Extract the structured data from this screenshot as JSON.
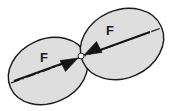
{
  "figure": {
    "background_color": "#ffffff",
    "body_fill_color": "#dedede",
    "body_stroke_color": "#1a1a1a",
    "line_color": "#1a1a1a",
    "arrow_color": "#141414",
    "contact_point_fill": "#ffffff",
    "labels": {
      "left_force": "F",
      "right_force": "F"
    },
    "bodies": [
      {
        "name": "left-body",
        "cx": 48,
        "cy": 71,
        "rx": 41,
        "ry": 32,
        "rotation_deg": -24,
        "label": "F",
        "label_x": 44,
        "label_y": 62
      },
      {
        "name": "right-body",
        "cx": 122,
        "cy": 44,
        "rx": 43,
        "ry": 34,
        "rotation_deg": -24,
        "label": "F",
        "label_x": 110,
        "label_y": 35
      }
    ],
    "contact_point": {
      "x": 81,
      "y": 56,
      "radius": 3
    },
    "center_line": {
      "name": "axis-center-line",
      "style": "dash-dot",
      "x1": 11,
      "y1": 83,
      "x2": 161,
      "y2": 28
    },
    "arrows": [
      {
        "name": "left-force-arrow",
        "direction": "right",
        "tail_x": 14,
        "tail_y": 81,
        "tip_x": 78,
        "tip_y": 58
      },
      {
        "name": "right-force-arrow",
        "direction": "left",
        "tail_x": 150,
        "tail_y": 32,
        "tip_x": 84,
        "tip_y": 55
      }
    ]
  }
}
